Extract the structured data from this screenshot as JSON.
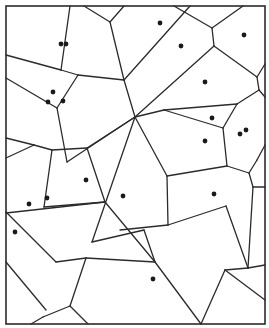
{
  "diagram": {
    "type": "voronoi",
    "width": 269,
    "height": 328,
    "colors": {
      "background": "#ffffff",
      "edge": "#2b2b2b",
      "site": "#1a1a1a"
    },
    "frame": {
      "x": 6,
      "y": 6,
      "w": 259,
      "h": 318
    },
    "sites": [
      [
        61,
        44
      ],
      [
        66,
        44
      ],
      [
        160,
        23
      ],
      [
        181,
        46
      ],
      [
        244,
        35
      ],
      [
        205,
        82
      ],
      [
        53,
        92
      ],
      [
        48,
        102
      ],
      [
        63,
        101
      ],
      [
        212,
        118
      ],
      [
        240,
        134
      ],
      [
        246,
        130
      ],
      [
        205,
        141
      ],
      [
        86,
        180
      ],
      [
        123,
        196
      ],
      [
        214,
        194
      ],
      [
        29,
        204
      ],
      [
        47,
        198
      ],
      [
        15,
        232
      ],
      [
        153,
        279
      ]
    ],
    "edges": [
      [
        [
          70,
          6
        ],
        [
          61,
          70
        ]
      ],
      [
        [
          6,
          55
        ],
        [
          61,
          70
        ]
      ],
      [
        [
          61,
          70
        ],
        [
          78,
          75
        ]
      ],
      [
        [
          84,
          6
        ],
        [
          110,
          22
        ]
      ],
      [
        [
          110,
          22
        ],
        [
          124,
          6
        ]
      ],
      [
        [
          110,
          22
        ],
        [
          124,
          80
        ]
      ],
      [
        [
          78,
          75
        ],
        [
          124,
          80
        ]
      ],
      [
        [
          124,
          80
        ],
        [
          190,
          6
        ]
      ],
      [
        [
          124,
          80
        ],
        [
          135,
          117
        ]
      ],
      [
        [
          78,
          75
        ],
        [
          57,
          108
        ]
      ],
      [
        [
          6,
          78
        ],
        [
          57,
          108
        ]
      ],
      [
        [
          57,
          108
        ],
        [
          67,
          162
        ]
      ],
      [
        [
          67,
          162
        ],
        [
          135,
          117
        ]
      ],
      [
        [
          174,
          6
        ],
        [
          212,
          28
        ]
      ],
      [
        [
          212,
          28
        ],
        [
          243,
          6
        ]
      ],
      [
        [
          212,
          28
        ],
        [
          214,
          46
        ]
      ],
      [
        [
          214,
          46
        ],
        [
          135,
          117
        ]
      ],
      [
        [
          214,
          46
        ],
        [
          257,
          77
        ]
      ],
      [
        [
          257,
          77
        ],
        [
          265,
          64
        ]
      ],
      [
        [
          257,
          77
        ],
        [
          259,
          90
        ]
      ],
      [
        [
          259,
          90
        ],
        [
          265,
          97
        ]
      ],
      [
        [
          259,
          90
        ],
        [
          237,
          104
        ]
      ],
      [
        [
          237,
          104
        ],
        [
          164,
          110
        ]
      ],
      [
        [
          164,
          110
        ],
        [
          135,
          117
        ]
      ],
      [
        [
          164,
          110
        ],
        [
          223,
          128
        ]
      ],
      [
        [
          223,
          128
        ],
        [
          237,
          104
        ]
      ],
      [
        [
          223,
          128
        ],
        [
          227,
          166
        ]
      ],
      [
        [
          227,
          166
        ],
        [
          249,
          173
        ]
      ],
      [
        [
          249,
          173
        ],
        [
          257,
          160
        ]
      ],
      [
        [
          257,
          160
        ],
        [
          265,
          145
        ]
      ],
      [
        [
          249,
          173
        ],
        [
          253,
          187
        ]
      ],
      [
        [
          253,
          187
        ],
        [
          265,
          187
        ]
      ],
      [
        [
          253,
          187
        ],
        [
          248,
          268
        ]
      ],
      [
        [
          248,
          268
        ],
        [
          265,
          265
        ]
      ],
      [
        [
          227,
          166
        ],
        [
          167,
          176
        ]
      ],
      [
        [
          135,
          117
        ],
        [
          167,
          176
        ]
      ],
      [
        [
          167,
          176
        ],
        [
          168,
          225
        ]
      ],
      [
        [
          168,
          225
        ],
        [
          226,
          206
        ]
      ],
      [
        [
          226,
          206
        ],
        [
          248,
          268
        ]
      ],
      [
        [
          135,
          117
        ],
        [
          87,
          148
        ]
      ],
      [
        [
          87,
          148
        ],
        [
          52,
          150
        ]
      ],
      [
        [
          52,
          150
        ],
        [
          34,
          145
        ]
      ],
      [
        [
          34,
          145
        ],
        [
          6,
          138
        ]
      ],
      [
        [
          34,
          145
        ],
        [
          6,
          158
        ]
      ],
      [
        [
          52,
          150
        ],
        [
          44,
          207
        ]
      ],
      [
        [
          87,
          148
        ],
        [
          105,
          202
        ]
      ],
      [
        [
          105,
          202
        ],
        [
          6,
          213
        ]
      ],
      [
        [
          105,
          202
        ],
        [
          155,
          262
        ]
      ],
      [
        [
          44,
          207
        ],
        [
          105,
          202
        ]
      ],
      [
        [
          135,
          117
        ],
        [
          92,
          242
        ]
      ],
      [
        [
          92,
          242
        ],
        [
          144,
          230
        ]
      ],
      [
        [
          144,
          230
        ],
        [
          155,
          262
        ]
      ],
      [
        [
          168,
          225
        ],
        [
          120,
          230
        ]
      ],
      [
        [
          86,
          258
        ],
        [
          56,
          262
        ]
      ],
      [
        [
          56,
          262
        ],
        [
          6,
          212
        ]
      ],
      [
        [
          155,
          262
        ],
        [
          86,
          258
        ]
      ],
      [
        [
          86,
          258
        ],
        [
          70,
          306
        ]
      ],
      [
        [
          70,
          306
        ],
        [
          43,
          317
        ]
      ],
      [
        [
          43,
          317
        ],
        [
          31,
          324
        ]
      ],
      [
        [
          70,
          306
        ],
        [
          88,
          324
        ]
      ],
      [
        [
          6,
          262
        ],
        [
          46,
          310
        ]
      ],
      [
        [
          248,
          268
        ],
        [
          225,
          270
        ]
      ],
      [
        [
          225,
          270
        ],
        [
          201,
          324
        ]
      ],
      [
        [
          225,
          270
        ],
        [
          265,
          300
        ]
      ],
      [
        [
          155,
          262
        ],
        [
          201,
          324
        ]
      ]
    ]
  }
}
